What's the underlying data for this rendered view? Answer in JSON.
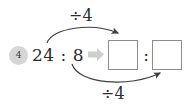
{
  "diagram": {
    "badge": {
      "label": "4"
    },
    "expression": {
      "text": "24 : 8"
    },
    "transform_arrow": {
      "icon": "right-arrow-icon"
    },
    "operations": [
      {
        "id": "top",
        "label": "÷4"
      },
      {
        "id": "bottom",
        "label": "÷4"
      }
    ],
    "result": {
      "left_box": {
        "value": ""
      },
      "separator": ":",
      "right_box": {
        "value": ""
      }
    },
    "colors": {
      "badge_fill": "#d6d6d6",
      "text": "#2b2b2b",
      "box_border": "#8c8c8c",
      "curve_stroke": "#3f3f3f",
      "block_arrow": "#cfcfcf"
    }
  }
}
